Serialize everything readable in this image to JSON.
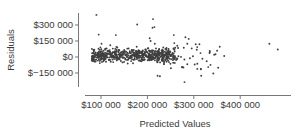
{
  "chart_data": {
    "type": "scatter",
    "title": "",
    "xlabel": "Predicted Values",
    "ylabel": "Residuals",
    "x_ticks": [
      {
        "value": 100000,
        "label": "$100 000"
      },
      {
        "value": 200000,
        "label": "$200 000"
      },
      {
        "value": 300000,
        "label": "$300 000"
      },
      {
        "value": 400000,
        "label": "$400 000"
      }
    ],
    "y_ticks": [
      {
        "value": 300000,
        "label": "$300 000"
      },
      {
        "value": 150000,
        "label": "$150 000"
      },
      {
        "value": 0,
        "label": "$0"
      },
      {
        "value": -150000,
        "label": "$−150 000"
      }
    ],
    "xlim": [
      65000,
      500000
    ],
    "ylim": [
      -270000,
      420000
    ],
    "grid": false,
    "legend": null,
    "point_color": "#3f3f3f",
    "cluster": {
      "description": "dense main cloud of residuals centered near $0",
      "n": 620,
      "x_range": [
        80000,
        270000
      ],
      "y_center": 0,
      "y_spread": 40000
    },
    "sparse_region": {
      "n": 45,
      "x_range": [
        230000,
        370000
      ],
      "y_range": [
        -120000,
        110000
      ]
    },
    "outliers": [
      {
        "x": 90000,
        "y": 395000
      },
      {
        "x": 95000,
        "y": 210000
      },
      {
        "x": 132000,
        "y": 205000
      },
      {
        "x": 178000,
        "y": 305000
      },
      {
        "x": 101000,
        "y": 125000
      },
      {
        "x": 120000,
        "y": 110000
      },
      {
        "x": 212000,
        "y": 355000
      },
      {
        "x": 211000,
        "y": 275000
      },
      {
        "x": 215000,
        "y": 280000
      },
      {
        "x": 205000,
        "y": 175000
      },
      {
        "x": 207000,
        "y": 150000
      },
      {
        "x": 216000,
        "y": 125000
      },
      {
        "x": 257000,
        "y": 205000
      },
      {
        "x": 258000,
        "y": 130000
      },
      {
        "x": 282000,
        "y": 185000
      },
      {
        "x": 289000,
        "y": 170000
      },
      {
        "x": 286000,
        "y": 125000
      },
      {
        "x": 304000,
        "y": 120000
      },
      {
        "x": 312000,
        "y": 120000
      },
      {
        "x": 222000,
        "y": -175000
      },
      {
        "x": 227000,
        "y": -180000
      },
      {
        "x": 280000,
        "y": -235000
      },
      {
        "x": 316000,
        "y": -175000
      },
      {
        "x": 342000,
        "y": -155000
      },
      {
        "x": 368000,
        "y": -335000
      },
      {
        "x": 302000,
        "y": -70000
      },
      {
        "x": 331000,
        "y": -95000
      },
      {
        "x": 463000,
        "y": 125000
      },
      {
        "x": 481000,
        "y": 70000
      }
    ]
  }
}
